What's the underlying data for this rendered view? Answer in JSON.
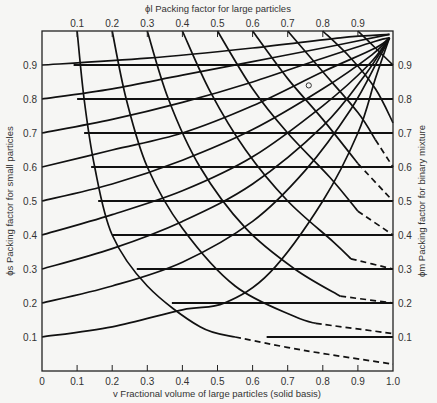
{
  "chart_data": {
    "type": "line",
    "xlabel": "v Fractional volume of large particles (solid basis)",
    "ylabel_left": "ϕs Packing factor for small particles",
    "ylabel_right": "ϕm Packing factor for binary mixture",
    "xlabel_top": "ϕl Packing factor for large particles",
    "xlim": [
      0,
      1.0
    ],
    "ylim": [
      0,
      1.0
    ],
    "x_ticks": [
      "0",
      "0.1",
      "0.2",
      "0.3",
      "0.4",
      "0.5",
      "0.6",
      "0.7",
      "0.8",
      "0.9",
      "1.0"
    ],
    "top_ticks": [
      "0.1",
      "0.2",
      "0.3",
      "0.4",
      "0.5",
      "0.6",
      "0.7",
      "0.8",
      "0.9"
    ],
    "left_ticks": [
      "0.1",
      "0.2",
      "0.3",
      "0.4",
      "0.5",
      "0.6",
      "0.7",
      "0.8",
      "0.9"
    ],
    "right_ticks": [
      "0.1",
      "0.2",
      "0.3",
      "0.4",
      "0.5",
      "0.6",
      "0.7",
      "0.8",
      "0.9"
    ],
    "phi_m_lines": [
      {
        "phi_m": 0.9,
        "v_start": 0.09
      },
      {
        "phi_m": 0.8,
        "v_start": 0.1
      },
      {
        "phi_m": 0.7,
        "v_start": 0.12
      },
      {
        "phi_m": 0.6,
        "v_start": 0.14
      },
      {
        "phi_m": 0.5,
        "v_start": 0.16
      },
      {
        "phi_m": 0.4,
        "v_start": 0.2
      },
      {
        "phi_m": 0.3,
        "v_start": 0.27
      },
      {
        "phi_m": 0.2,
        "v_start": 0.37
      },
      {
        "phi_m": 0.1,
        "v_start": 0.64
      }
    ],
    "phi_s_curves": [
      {
        "phi_s": 0.1,
        "points": [
          [
            0,
            0.1
          ],
          [
            0.2,
            0.13
          ],
          [
            0.4,
            0.18
          ],
          [
            0.52,
            0.2
          ],
          [
            0.65,
            0.29
          ],
          [
            0.8,
            0.5
          ],
          [
            0.9,
            0.7
          ],
          [
            0.95,
            0.86
          ],
          [
            0.99,
            0.98
          ]
        ]
      },
      {
        "phi_s": 0.2,
        "points": [
          [
            0,
            0.2
          ],
          [
            0.2,
            0.25
          ],
          [
            0.4,
            0.32
          ],
          [
            0.6,
            0.44
          ],
          [
            0.75,
            0.59
          ],
          [
            0.88,
            0.77
          ],
          [
            0.96,
            0.92
          ],
          [
            0.99,
            0.98
          ]
        ]
      },
      {
        "phi_s": 0.3,
        "points": [
          [
            0,
            0.3
          ],
          [
            0.2,
            0.36
          ],
          [
            0.4,
            0.44
          ],
          [
            0.6,
            0.55
          ],
          [
            0.8,
            0.72
          ],
          [
            0.92,
            0.87
          ],
          [
            0.99,
            0.98
          ]
        ]
      },
      {
        "phi_s": 0.4,
        "points": [
          [
            0,
            0.4
          ],
          [
            0.2,
            0.46
          ],
          [
            0.4,
            0.53
          ],
          [
            0.6,
            0.63
          ],
          [
            0.8,
            0.78
          ],
          [
            0.93,
            0.9
          ],
          [
            0.99,
            0.98
          ]
        ]
      },
      {
        "phi_s": 0.5,
        "points": [
          [
            0,
            0.5
          ],
          [
            0.2,
            0.55
          ],
          [
            0.4,
            0.62
          ],
          [
            0.6,
            0.71
          ],
          [
            0.8,
            0.83
          ],
          [
            0.94,
            0.93
          ],
          [
            0.99,
            0.98
          ]
        ]
      },
      {
        "phi_s": 0.6,
        "points": [
          [
            0,
            0.6
          ],
          [
            0.2,
            0.65
          ],
          [
            0.4,
            0.7
          ],
          [
            0.6,
            0.78
          ],
          [
            0.8,
            0.88
          ],
          [
            0.95,
            0.95
          ],
          [
            0.99,
            0.98
          ]
        ]
      },
      {
        "phi_s": 0.7,
        "points": [
          [
            0,
            0.7
          ],
          [
            0.2,
            0.74
          ],
          [
            0.4,
            0.79
          ],
          [
            0.6,
            0.85
          ],
          [
            0.8,
            0.92
          ],
          [
            0.95,
            0.97
          ],
          [
            0.99,
            0.98
          ]
        ]
      },
      {
        "phi_s": 0.8,
        "points": [
          [
            0,
            0.8
          ],
          [
            0.2,
            0.83
          ],
          [
            0.4,
            0.87
          ],
          [
            0.6,
            0.91
          ],
          [
            0.8,
            0.95
          ],
          [
            0.99,
            0.99
          ]
        ]
      },
      {
        "phi_s": 0.9,
        "points": [
          [
            0,
            0.9
          ],
          [
            0.3,
            0.92
          ],
          [
            0.6,
            0.95
          ],
          [
            0.85,
            0.98
          ],
          [
            0.99,
            0.99
          ]
        ]
      }
    ],
    "phi_l_curves": [
      {
        "phi_l": 0.1,
        "points": [
          [
            0.1,
            1.0
          ],
          [
            0.12,
            0.8
          ],
          [
            0.15,
            0.6
          ],
          [
            0.2,
            0.4
          ],
          [
            0.3,
            0.25
          ],
          [
            0.45,
            0.13
          ],
          [
            0.55,
            0.1
          ]
        ],
        "dashed_tail": [
          [
            0.55,
            0.1
          ],
          [
            0.75,
            0.06
          ],
          [
            1.0,
            0.02
          ]
        ]
      },
      {
        "phi_l": 0.2,
        "points": [
          [
            0.2,
            1.0
          ],
          [
            0.24,
            0.8
          ],
          [
            0.3,
            0.6
          ],
          [
            0.4,
            0.42
          ],
          [
            0.55,
            0.25
          ],
          [
            0.72,
            0.16
          ],
          [
            0.78,
            0.14
          ]
        ],
        "dashed_tail": [
          [
            0.78,
            0.14
          ],
          [
            1.0,
            0.11
          ]
        ]
      },
      {
        "phi_l": 0.3,
        "points": [
          [
            0.3,
            1.0
          ],
          [
            0.36,
            0.8
          ],
          [
            0.45,
            0.6
          ],
          [
            0.58,
            0.42
          ],
          [
            0.72,
            0.3
          ],
          [
            0.85,
            0.22
          ]
        ],
        "dashed_tail": [
          [
            0.85,
            0.22
          ],
          [
            1.0,
            0.2
          ]
        ]
      },
      {
        "phi_l": 0.4,
        "points": [
          [
            0.4,
            1.0
          ],
          [
            0.48,
            0.82
          ],
          [
            0.58,
            0.65
          ],
          [
            0.7,
            0.5
          ],
          [
            0.83,
            0.38
          ],
          [
            0.88,
            0.33
          ]
        ],
        "dashed_tail": [
          [
            0.88,
            0.33
          ],
          [
            1.0,
            0.3
          ]
        ]
      },
      {
        "phi_l": 0.5,
        "points": [
          [
            0.5,
            1.0
          ],
          [
            0.6,
            0.83
          ],
          [
            0.7,
            0.7
          ],
          [
            0.82,
            0.57
          ],
          [
            0.9,
            0.47
          ]
        ],
        "dashed_tail": [
          [
            0.9,
            0.47
          ],
          [
            1.0,
            0.4
          ]
        ]
      },
      {
        "phi_l": 0.6,
        "points": [
          [
            0.6,
            1.0
          ],
          [
            0.7,
            0.86
          ],
          [
            0.8,
            0.74
          ],
          [
            0.9,
            0.61
          ]
        ],
        "dashed_tail": [
          [
            0.9,
            0.61
          ],
          [
            1.0,
            0.5
          ]
        ]
      },
      {
        "phi_l": 0.7,
        "points": [
          [
            0.7,
            1.0
          ],
          [
            0.8,
            0.88
          ],
          [
            0.9,
            0.76
          ],
          [
            0.95,
            0.68
          ]
        ],
        "dashed_tail": [
          [
            0.95,
            0.68
          ],
          [
            1.0,
            0.6
          ]
        ]
      },
      {
        "phi_l": 0.8,
        "points": [
          [
            0.8,
            1.0
          ],
          [
            0.88,
            0.92
          ],
          [
            0.95,
            0.83
          ],
          [
            1.0,
            0.73
          ]
        ]
      },
      {
        "phi_l": 0.9,
        "points": [
          [
            0.9,
            1.0
          ],
          [
            0.95,
            0.95
          ],
          [
            1.0,
            0.9
          ]
        ]
      }
    ],
    "marker": {
      "v": 0.76,
      "phi": 0.84,
      "shape": "open-circle"
    }
  }
}
